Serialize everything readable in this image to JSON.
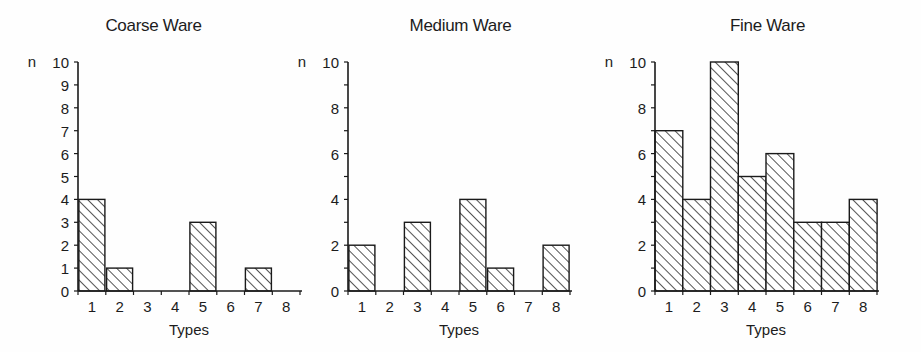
{
  "figure": {
    "background": "#fefefe",
    "ink": "#1a1a1a",
    "panel_count": 3
  },
  "chart_data": [
    {
      "type": "bar",
      "title": "Coarse Ware",
      "xlabel": "Types",
      "ylabel": "n",
      "categories": [
        "1",
        "2",
        "3",
        "4",
        "5",
        "6",
        "7",
        "8"
      ],
      "values": [
        4,
        1,
        0,
        0,
        3,
        0,
        1,
        0
      ],
      "ylim": [
        0,
        10
      ],
      "ytick_values": [
        0,
        1,
        2,
        3,
        4,
        5,
        6,
        7,
        8,
        9,
        10
      ],
      "ytick_labels": [
        "0",
        "1",
        "2",
        "3",
        "4",
        "5",
        "6",
        "7",
        "8",
        "9",
        "10"
      ],
      "grid": false,
      "legend": null,
      "bar_style": "diagonal-hatch",
      "bar_fill": "#ffffff",
      "bar_edge": "#1a1a1a"
    },
    {
      "type": "bar",
      "title": "Medium Ware",
      "xlabel": "Types",
      "ylabel": "n",
      "categories": [
        "1",
        "2",
        "3",
        "4",
        "5",
        "6",
        "7",
        "8"
      ],
      "values": [
        2,
        0,
        3,
        0,
        4,
        1,
        0,
        2
      ],
      "ylim": [
        0,
        10
      ],
      "ytick_values": [
        0,
        1,
        2,
        3,
        4,
        5,
        6,
        7,
        8,
        9,
        10
      ],
      "ytick_labels": [
        "0",
        "",
        "2",
        "",
        "4",
        "",
        "6",
        "",
        "8",
        "",
        "10"
      ],
      "grid": false,
      "legend": null,
      "bar_style": "diagonal-hatch",
      "bar_fill": "#ffffff",
      "bar_edge": "#1a1a1a"
    },
    {
      "type": "bar",
      "title": "Fine Ware",
      "xlabel": "Types",
      "ylabel": "n",
      "categories": [
        "1",
        "2",
        "3",
        "4",
        "5",
        "6",
        "7",
        "8"
      ],
      "values": [
        7,
        4,
        10,
        5,
        6,
        3,
        3,
        4
      ],
      "ylim": [
        0,
        10
      ],
      "ytick_values": [
        0,
        1,
        2,
        3,
        4,
        5,
        6,
        7,
        8,
        9,
        10
      ],
      "ytick_labels": [
        "0",
        "",
        "2",
        "",
        "4",
        "",
        "6",
        "",
        "8",
        "",
        "10"
      ],
      "grid": false,
      "legend": null,
      "bar_style": "diagonal-hatch",
      "bar_fill": "#ffffff",
      "bar_edge": "#1a1a1a"
    }
  ],
  "layout": {
    "panels": [
      {
        "left": 0,
        "width": 307,
        "plot_left": 78,
        "plot_top": 62,
        "plot_width": 222,
        "plot_height": 229,
        "bar_width": 26,
        "bar_gap_mode": "spaced"
      },
      {
        "left": 307,
        "width": 307,
        "plot_left": 41,
        "plot_top": 62,
        "plot_width": 222,
        "plot_height": 229,
        "bar_width": 26,
        "bar_gap_mode": "spaced"
      },
      {
        "left": 614,
        "width": 307,
        "plot_left": 41,
        "plot_top": 62,
        "plot_width": 222,
        "plot_height": 229,
        "bar_width": 26,
        "bar_gap_mode": "touching"
      }
    ]
  }
}
